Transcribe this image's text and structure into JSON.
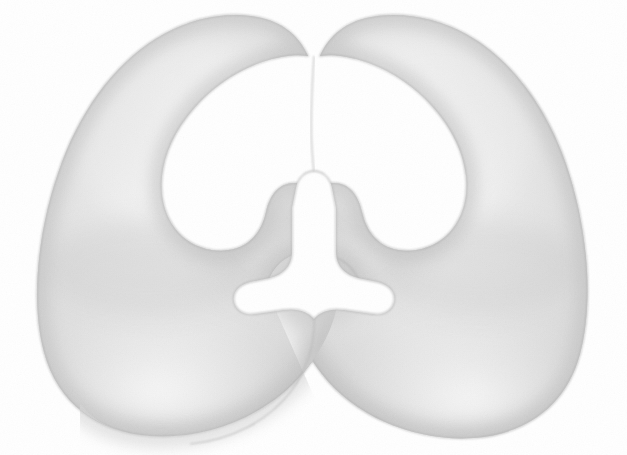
{
  "image": {
    "kind": "botanical-pencil-illustration",
    "subject": "split seed cotyledons",
    "description": "Two large kidney-shaped lobes meeting at the centre, drawn in soft graphite shading on white paper, enclosing a Y-shaped (trefoil) white gap at the middle",
    "width": 627,
    "height": 455,
    "orientation": "landscape",
    "technique": "graphite pencil / smooth tonal shading",
    "alt_text": "Pale grey pencil drawing of two rounded lobes forming a symmetrical seed shape with a small anchor-shaped white opening at the centre"
  },
  "palette": {
    "background": "#ffffff",
    "paper": "#ffffff",
    "outline": "#b9b9b9",
    "outline_soft": "#c9c9c9",
    "shadow_deep": "#c4c4c4",
    "shadow_mid": "#dcdcdc",
    "shadow_light": "#eeeeee",
    "highlight": "#fbfbfb",
    "gap_fill": "#ffffff"
  },
  "elements": {
    "left_lobe": {
      "label": "Left cotyledon lobe",
      "highlight_center": "32%, 30%",
      "tone": "light grey with bright upper-left highlight"
    },
    "right_lobe": {
      "label": "Right cotyledon lobe",
      "highlight_center": "62%, 28%",
      "tone": "light grey with bright upper-centre highlight"
    },
    "center_gap": {
      "label": "Central Y-shaped opening",
      "shape": "trefoil / anchor",
      "fill": "#ffffff",
      "bounds": "x 250-378, y 170-292"
    },
    "top_cleft": {
      "label": "Upper cleft between lobes",
      "depth_y": 55
    },
    "overlap_seam": {
      "label": "Lower overlap seam",
      "note": "left lobe edge curves across the right lobe toward the bottom centre"
    }
  },
  "geometry": {
    "left_lobe_path": "M 300 52 C 292 34 250 18 200 27 C 140 38 86 96 62 170 C 36 250 40 330 78 380 C 116 430 190 448 258 432 C 320 418 352 372 346 318 C 342 276 318 262 280 266 C 252 268 246 288 252 292 L 252 292 C 256 282 268 278 282 280 C 300 282 306 292 306 292 L 306 200 C 306 182 296 178 286 178 C 270 178 260 190 258 206 C 254 236 230 252 196 244 C 156 234 138 196 146 156 C 156 108 206 68 260 58 Z",
    "right_lobe_path": "M 318 52 C 326 34 372 18 424 28 C 488 40 542 100 566 176 C 590 254 586 334 548 384 C 510 434 436 450 370 434 C 306 418 272 372 278 318 C 282 276 306 262 342 266 C 368 268 376 288 370 292 C 366 282 354 278 340 280 C 322 282 316 292 316 292 L 316 200 C 316 182 326 178 336 178 C 352 178 362 190 364 206 C 368 236 392 252 426 244 C 466 234 484 196 476 156 C 466 108 414 68 360 58 Z"
  },
  "notes": {
    "center_gap_note": "Pure white, no shading inside",
    "background_note": "Uniform white, no border or frame",
    "texture_note": "Faint paper grain visible across the shaded areas"
  }
}
